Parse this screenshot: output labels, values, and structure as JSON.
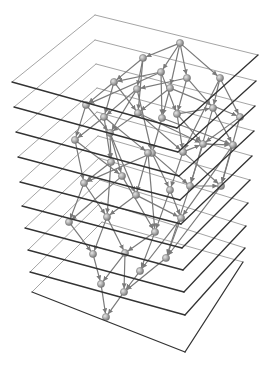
{
  "diagram": {
    "type": "layered-graph-3d",
    "width": 275,
    "height": 368,
    "colors": {
      "background": "#ffffff",
      "plane_front_edge": "#333333",
      "plane_back_edge": "#9a9a9a",
      "edge": "#7a7a7a",
      "node_fill": "#a8a8a8",
      "node_stroke": "#6f6f6f",
      "node_highlight": "#e6e6e6"
    },
    "planes": [
      {
        "top": [
          95,
          15
        ],
        "right": [
          258,
          55
        ],
        "bottom": [
          177,
          128
        ],
        "left": [
          12,
          82
        ]
      },
      {
        "top": [
          95,
          40
        ],
        "right": [
          256,
          81
        ],
        "bottom": [
          178,
          152
        ],
        "left": [
          14,
          107
        ]
      },
      {
        "top": [
          96,
          64
        ],
        "right": [
          255,
          106
        ],
        "bottom": [
          179,
          176
        ],
        "left": [
          16,
          132
        ]
      },
      {
        "top": [
          97,
          88
        ],
        "right": [
          254,
          131
        ],
        "bottom": [
          180,
          200
        ],
        "left": [
          18,
          157
        ]
      },
      {
        "top": [
          97,
          112
        ],
        "right": [
          252,
          156
        ],
        "bottom": [
          181,
          224
        ],
        "left": [
          20,
          182
        ]
      },
      {
        "top": [
          98,
          136
        ],
        "right": [
          250,
          180
        ],
        "bottom": [
          182,
          248
        ],
        "left": [
          22,
          206
        ]
      },
      {
        "top": [
          99,
          158
        ],
        "right": [
          248,
          203
        ],
        "bottom": [
          183,
          270
        ],
        "left": [
          25,
          228
        ]
      },
      {
        "top": [
          100,
          180
        ],
        "right": [
          246,
          226
        ],
        "bottom": [
          184,
          292
        ],
        "left": [
          28,
          250
        ]
      },
      {
        "top": [
          101,
          202
        ],
        "right": [
          245,
          248
        ],
        "bottom": [
          185,
          315
        ],
        "left": [
          30,
          272
        ]
      },
      {
        "top": [
          102,
          222
        ],
        "right": [
          243,
          262
        ],
        "bottom": [
          185,
          352
        ],
        "left": [
          32,
          292
        ]
      }
    ],
    "nodes": [
      {
        "id": "n0",
        "x": 180,
        "y": 43
      },
      {
        "id": "n1",
        "x": 143,
        "y": 58
      },
      {
        "id": "n2",
        "x": 161,
        "y": 72
      },
      {
        "id": "n3",
        "x": 187,
        "y": 78
      },
      {
        "id": "n4",
        "x": 220,
        "y": 78
      },
      {
        "id": "n5",
        "x": 114,
        "y": 82
      },
      {
        "id": "n6",
        "x": 137,
        "y": 89
      },
      {
        "id": "n7",
        "x": 170,
        "y": 88
      },
      {
        "id": "n8",
        "x": 86,
        "y": 105
      },
      {
        "id": "n9",
        "x": 104,
        "y": 117
      },
      {
        "id": "n10",
        "x": 138,
        "y": 113
      },
      {
        "id": "n11",
        "x": 162,
        "y": 118
      },
      {
        "id": "n12",
        "x": 177,
        "y": 114
      },
      {
        "id": "n13",
        "x": 213,
        "y": 108
      },
      {
        "id": "n14",
        "x": 240,
        "y": 117
      },
      {
        "id": "n15",
        "x": 75,
        "y": 140
      },
      {
        "id": "n16",
        "x": 110,
        "y": 133
      },
      {
        "id": "n17",
        "x": 152,
        "y": 153
      },
      {
        "id": "n18",
        "x": 183,
        "y": 152
      },
      {
        "id": "n19",
        "x": 203,
        "y": 144
      },
      {
        "id": "n20",
        "x": 233,
        "y": 145
      },
      {
        "id": "n21",
        "x": 111,
        "y": 162
      },
      {
        "id": "n22",
        "x": 148,
        "y": 153
      },
      {
        "id": "n23",
        "x": 84,
        "y": 183
      },
      {
        "id": "n24",
        "x": 122,
        "y": 176
      },
      {
        "id": "n25",
        "x": 136,
        "y": 195
      },
      {
        "id": "n26",
        "x": 170,
        "y": 190
      },
      {
        "id": "n27",
        "x": 190,
        "y": 186
      },
      {
        "id": "n28",
        "x": 221,
        "y": 186
      },
      {
        "id": "n29",
        "x": 69,
        "y": 222
      },
      {
        "id": "n30",
        "x": 107,
        "y": 217
      },
      {
        "id": "n31",
        "x": 155,
        "y": 232
      },
      {
        "id": "n32",
        "x": 181,
        "y": 218
      },
      {
        "id": "n33",
        "x": 93,
        "y": 254
      },
      {
        "id": "n34",
        "x": 125,
        "y": 253
      },
      {
        "id": "n35",
        "x": 166,
        "y": 258
      },
      {
        "id": "n36",
        "x": 140,
        "y": 271
      },
      {
        "id": "n37",
        "x": 101,
        "y": 284
      },
      {
        "id": "n38",
        "x": 124,
        "y": 292
      },
      {
        "id": "n39",
        "x": 106,
        "y": 317
      }
    ],
    "edges": [
      [
        "n0",
        "n1"
      ],
      [
        "n0",
        "n2"
      ],
      [
        "n0",
        "n3"
      ],
      [
        "n0",
        "n4"
      ],
      [
        "n0",
        "n7"
      ],
      [
        "n1",
        "n5"
      ],
      [
        "n1",
        "n6"
      ],
      [
        "n1",
        "n10"
      ],
      [
        "n2",
        "n5"
      ],
      [
        "n2",
        "n8"
      ],
      [
        "n2",
        "n11"
      ],
      [
        "n2",
        "n12"
      ],
      [
        "n3",
        "n6"
      ],
      [
        "n3",
        "n12"
      ],
      [
        "n3",
        "n13"
      ],
      [
        "n4",
        "n13"
      ],
      [
        "n4",
        "n14"
      ],
      [
        "n4",
        "n18"
      ],
      [
        "n5",
        "n8"
      ],
      [
        "n5",
        "n9"
      ],
      [
        "n5",
        "n10"
      ],
      [
        "n6",
        "n9"
      ],
      [
        "n6",
        "n16"
      ],
      [
        "n6",
        "n17"
      ],
      [
        "n7",
        "n10"
      ],
      [
        "n7",
        "n11"
      ],
      [
        "n7",
        "n14"
      ],
      [
        "n8",
        "n15"
      ],
      [
        "n8",
        "n16"
      ],
      [
        "n9",
        "n15"
      ],
      [
        "n9",
        "n21"
      ],
      [
        "n9",
        "n22"
      ],
      [
        "n10",
        "n16"
      ],
      [
        "n10",
        "n18"
      ],
      [
        "n10",
        "n19"
      ],
      [
        "n11",
        "n17"
      ],
      [
        "n11",
        "n20"
      ],
      [
        "n12",
        "n13"
      ],
      [
        "n12",
        "n18"
      ],
      [
        "n12",
        "n19"
      ],
      [
        "n13",
        "n20"
      ],
      [
        "n13",
        "n27"
      ],
      [
        "n14",
        "n19"
      ],
      [
        "n14",
        "n28"
      ],
      [
        "n15",
        "n23"
      ],
      [
        "n15",
        "n24"
      ],
      [
        "n16",
        "n21"
      ],
      [
        "n16",
        "n24"
      ],
      [
        "n16",
        "n25"
      ],
      [
        "n17",
        "n22"
      ],
      [
        "n17",
        "n26"
      ],
      [
        "n17",
        "n27"
      ],
      [
        "n17",
        "n23"
      ],
      [
        "n18",
        "n19"
      ],
      [
        "n18",
        "n26"
      ],
      [
        "n18",
        "n28"
      ],
      [
        "n19",
        "n20"
      ],
      [
        "n19",
        "n27"
      ],
      [
        "n20",
        "n28"
      ],
      [
        "n20",
        "n32"
      ],
      [
        "n21",
        "n23"
      ],
      [
        "n21",
        "n30"
      ],
      [
        "n22",
        "n25"
      ],
      [
        "n22",
        "n31"
      ],
      [
        "n23",
        "n29"
      ],
      [
        "n23",
        "n30"
      ],
      [
        "n24",
        "n29"
      ],
      [
        "n24",
        "n31"
      ],
      [
        "n25",
        "n30"
      ],
      [
        "n25",
        "n32"
      ],
      [
        "n26",
        "n31"
      ],
      [
        "n26",
        "n32"
      ],
      [
        "n27",
        "n28"
      ],
      [
        "n27",
        "n35"
      ],
      [
        "n28",
        "n35"
      ],
      [
        "n29",
        "n33"
      ],
      [
        "n30",
        "n33"
      ],
      [
        "n30",
        "n34"
      ],
      [
        "n31",
        "n34"
      ],
      [
        "n31",
        "n36"
      ],
      [
        "n32",
        "n35"
      ],
      [
        "n32",
        "n36"
      ],
      [
        "n33",
        "n37"
      ],
      [
        "n34",
        "n37"
      ],
      [
        "n34",
        "n38"
      ],
      [
        "n35",
        "n38"
      ],
      [
        "n36",
        "n38"
      ],
      [
        "n37",
        "n39"
      ],
      [
        "n38",
        "n39"
      ]
    ],
    "labels": []
  }
}
